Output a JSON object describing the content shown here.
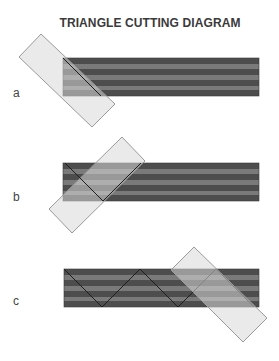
{
  "title": "TRIANGLE CUTTING  DIAGRAM",
  "colors": {
    "strip_dark": "#4d4d4d",
    "strip_light": "#7a7a7a",
    "ruler_fill": "#d9d9d9",
    "ruler_stroke": "#9a9a9a",
    "cut_line": "#1e1e1e"
  },
  "panels": [
    {
      "label": "a"
    },
    {
      "label": "b"
    },
    {
      "label": "c"
    }
  ]
}
